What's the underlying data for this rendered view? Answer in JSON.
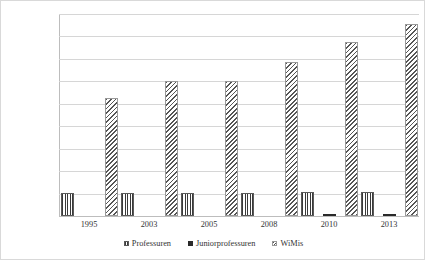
{
  "chart_data": {
    "type": "bar",
    "title": "",
    "subtitle": "",
    "xlabel": "",
    "ylabel": "",
    "categories": [
      "1995",
      "2003",
      "2005",
      "2008",
      "2010",
      "2013"
    ],
    "series": [
      {
        "name": "Professuren",
        "key": "professuren",
        "pattern": "vertical-stripes",
        "values": [
          20500,
          20500,
          20500,
          20500,
          21000,
          21500
        ]
      },
      {
        "name": "Juniorprofessuren",
        "key": "junior",
        "pattern": "solid-dark",
        "values": [
          0,
          0,
          0,
          0,
          1300,
          1600
        ]
      },
      {
        "name": "WiMis",
        "key": "wimis",
        "pattern": "diagonal-hatch",
        "values": [
          105000,
          120000,
          120000,
          137000,
          155000,
          171000
        ]
      }
    ],
    "ylim": [
      0,
      180000
    ],
    "ytick_step": 20000,
    "ytick_labels": [
      "180.000",
      "160.000",
      "140.000",
      "120.000",
      "100.000",
      "80.000",
      "60.000",
      "40.000",
      "20.000",
      "0"
    ],
    "ytick_values": [
      180000,
      160000,
      140000,
      120000,
      100000,
      80000,
      60000,
      40000,
      20000,
      0
    ],
    "grid": true,
    "grid_axis": "y",
    "legend_position": "bottom",
    "number_format": "de-DE",
    "colors": {
      "grid": "#d6d6d6",
      "axis": "#bdbdbd",
      "border": "#d9d9d9",
      "background": "#ffffff",
      "text": "#333333",
      "series_professuren": "#3a3a3a",
      "series_junior": "#2a2a2a",
      "series_wimis": "#555555"
    }
  }
}
